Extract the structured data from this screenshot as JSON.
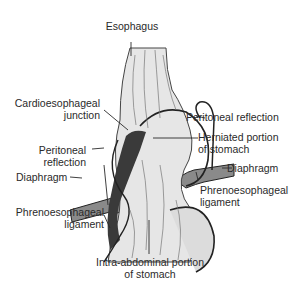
{
  "figure": {
    "type": "anatomical illustration",
    "labels": {
      "esophagus": "Esophagus",
      "cardioesophageal_1": "Cardioesophageal",
      "cardioesophageal_2": "junction",
      "peritoneal_left_1": "Peritoneal",
      "peritoneal_left_2": "reflection",
      "diaphragm_left": "Diaphragm",
      "phreno_left_1": "Phrenoesophageal",
      "phreno_left_2": "ligament",
      "intra_1": "Intra-abdominal portion",
      "intra_2": "of stomach",
      "peritoneal_right": "Peritoneal reflection",
      "herniated_1": "Herniated portion",
      "herniated_2": "of stomach",
      "diaphragm_right": "Diaphragm",
      "phreno_right_1": "Phrenoesophageal",
      "phreno_right_2": "ligament"
    },
    "colors": {
      "ink": "#2a2a2a",
      "tissue": "#d9d9d9",
      "muscle": "#7a7a7a",
      "background": "#ffffff"
    }
  }
}
